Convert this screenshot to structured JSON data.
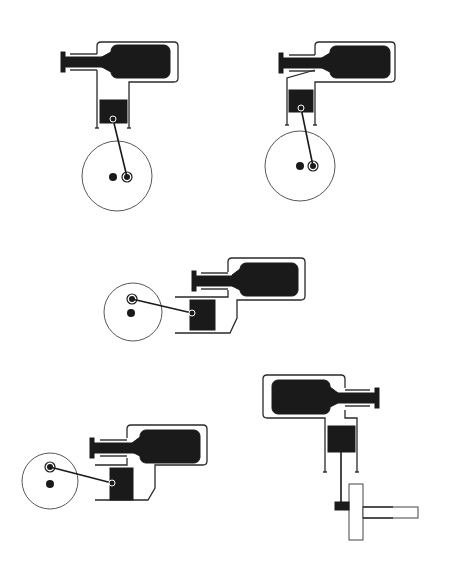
{
  "diagram": {
    "title": "",
    "colors": {
      "background": "#ffffff",
      "ink": "#1a1a1a",
      "line": "#2a2a2a",
      "disc_line": "#444444"
    },
    "engines": [
      {
        "id": "engine-top-left",
        "orientation": "vertical",
        "housing": {
          "x": 97,
          "y": 42,
          "w": 81,
          "h": 40
        },
        "displacer": {
          "x": 111,
          "y": 45,
          "w": 59,
          "h": 33
        },
        "displacer_rod": {
          "x1": 62,
          "y1": 62,
          "x2": 111,
          "y2": 62
        },
        "cylinder": {
          "left_x": 97,
          "right_x": 129,
          "top_y": 82,
          "bottom_y": 128
        },
        "piston": {
          "x": 100,
          "y": 100,
          "w": 27,
          "h": 23
        },
        "piston_pin": {
          "x": 113,
          "y": 119
        },
        "crank": {
          "cx": 117,
          "cy": 176,
          "r": 35,
          "shaft": {
            "x": 113,
            "y": 177
          },
          "pin": {
            "x": 127,
            "y": 177
          }
        }
      },
      {
        "id": "engine-top-right",
        "orientation": "vertical",
        "housing": {
          "x": 315,
          "y": 42,
          "w": 80,
          "h": 40
        },
        "displacer": {
          "x": 330,
          "y": 46,
          "w": 60,
          "h": 32
        },
        "displacer_rod": {
          "x1": 280,
          "y1": 63,
          "x2": 330,
          "y2": 63
        },
        "cylinder": {
          "left_x": 287,
          "right_x": 315,
          "top_y": 75,
          "bottom_y": 125
        },
        "piston": {
          "x": 289,
          "y": 90,
          "w": 24,
          "h": 22
        },
        "piston_pin": {
          "x": 301,
          "y": 108
        },
        "crank": {
          "cx": 300,
          "cy": 166,
          "r": 35,
          "shaft": {
            "x": 300,
            "y": 166
          },
          "pin": {
            "x": 313,
            "y": 166
          }
        }
      },
      {
        "id": "engine-middle",
        "orientation": "horizontal",
        "housing": {
          "x": 228,
          "y": 258,
          "w": 77,
          "h": 42
        },
        "displacer": {
          "x": 240,
          "y": 263,
          "w": 58,
          "h": 33
        },
        "displacer_rod": {
          "x1": 193,
          "y1": 281,
          "x2": 240,
          "y2": 281
        },
        "cylinder": {
          "left_x": 175,
          "right_x": 230,
          "top_y": 297,
          "bottom_y": 333
        },
        "piston": {
          "x": 190,
          "y": 300,
          "w": 25,
          "h": 30
        },
        "piston_pin": {
          "x": 192,
          "y": 313
        },
        "crank": {
          "cx": 133,
          "cy": 312,
          "r": 29,
          "shaft": {
            "x": 131,
            "y": 313
          },
          "pin": {
            "x": 132,
            "y": 299
          }
        }
      },
      {
        "id": "engine-bottom-left",
        "orientation": "horizontal",
        "housing": {
          "x": 127,
          "y": 425,
          "w": 80,
          "h": 40
        },
        "displacer": {
          "x": 140,
          "y": 430,
          "w": 60,
          "h": 33
        },
        "displacer_rod": {
          "x1": 91,
          "y1": 449,
          "x2": 140,
          "y2": 449
        },
        "cylinder": {
          "left_x": 95,
          "right_x": 152,
          "top_y": 465,
          "bottom_y": 500
        },
        "piston": {
          "x": 110,
          "y": 468,
          "w": 23,
          "h": 32
        },
        "piston_pin": {
          "x": 112,
          "y": 483
        },
        "crank": {
          "cx": 50,
          "cy": 481,
          "r": 28,
          "shaft": {
            "x": 50,
            "y": 483
          },
          "pin": {
            "x": 50,
            "y": 467
          }
        }
      },
      {
        "id": "engine-bottom-right",
        "orientation": "vertical-down",
        "housing": {
          "x": 263,
          "y": 375,
          "w": 82,
          "h": 43
        },
        "displacer": {
          "x": 272,
          "y": 380,
          "w": 58,
          "h": 34
        },
        "displacer_rod": {
          "x1": 330,
          "y1": 398,
          "x2": 378,
          "y2": 398
        },
        "cylinder": {
          "left_x": 325,
          "right_x": 357,
          "top_y": 418,
          "bottom_y": 472
        },
        "piston": {
          "x": 328,
          "y": 426,
          "w": 27,
          "h": 26
        },
        "piston_rod": {
          "x1": 341,
          "y1": 452,
          "x2": 341,
          "y2": 503
        },
        "flywheel": {
          "x": 349,
          "y": 484,
          "w": 14,
          "h": 56
        },
        "hub": {
          "x": 335,
          "y": 502,
          "w": 14,
          "h": 8
        },
        "output_shaft": {
          "x": 363,
          "y": 507,
          "w": 55,
          "h": 11
        }
      }
    ],
    "labels": []
  }
}
